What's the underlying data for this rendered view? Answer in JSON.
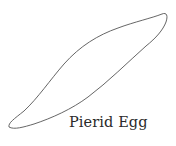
{
  "figure": {
    "stroke_color": "#555555",
    "caption": "Pierid Egg"
  }
}
